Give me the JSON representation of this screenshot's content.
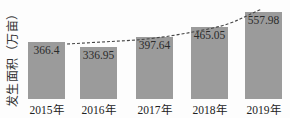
{
  "chart_data": {
    "type": "bar",
    "title": "",
    "xlabel": "",
    "ylabel": "发生面积（万亩）",
    "categories": [
      "2015年",
      "2016年",
      "2017年",
      "2018年",
      "2019年"
    ],
    "values": [
      366.4,
      336.95,
      397.64,
      465.05,
      557.98
    ],
    "value_labels": [
      "366.4",
      "336.95",
      "397.64",
      "465.05",
      "557.98"
    ],
    "ylim": [
      0,
      600
    ],
    "grid": false,
    "legend": null,
    "annotations": [
      "dashed trend line over bars"
    ],
    "colors": {
      "bar": "#9b9b9b",
      "trend": "#444444"
    }
  }
}
